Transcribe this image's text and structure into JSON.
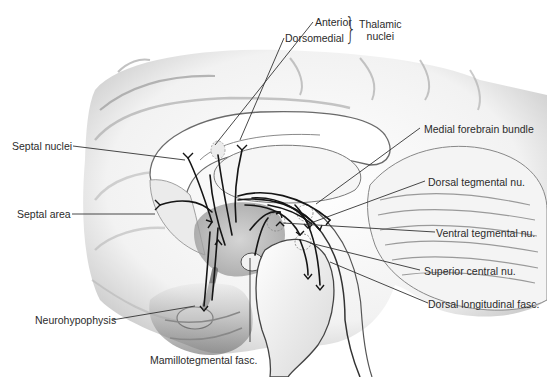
{
  "figure": {
    "labels": {
      "anterior": "Anterior",
      "dorsomedial": "Dorsomedial",
      "thalamic_group_line1": "Thalamic",
      "thalamic_group_line2": "nuclei",
      "septal_nuclei": "Septal nuclei",
      "septal_area": "Septal area",
      "neurohypophysis": "Neurohypophysis",
      "mamillotegmental": "Mamillotegmental fasc.",
      "medial_forebrain_bundle": "Medial forebrain bundle",
      "dorsal_tegmental": "Dorsal tegmental nu.",
      "ventral_tegmental": "Ventral tegmental nu.",
      "superior_central": "Superior central nu.",
      "dorsal_longitudinal": "Dorsal longitudinal fasc."
    },
    "colors": {
      "leader_line": "#333333",
      "fiber": "#1a1a1a",
      "brain_shade": "#bdbdbd",
      "hypothalamus_shade": "#9a9a9a"
    }
  }
}
